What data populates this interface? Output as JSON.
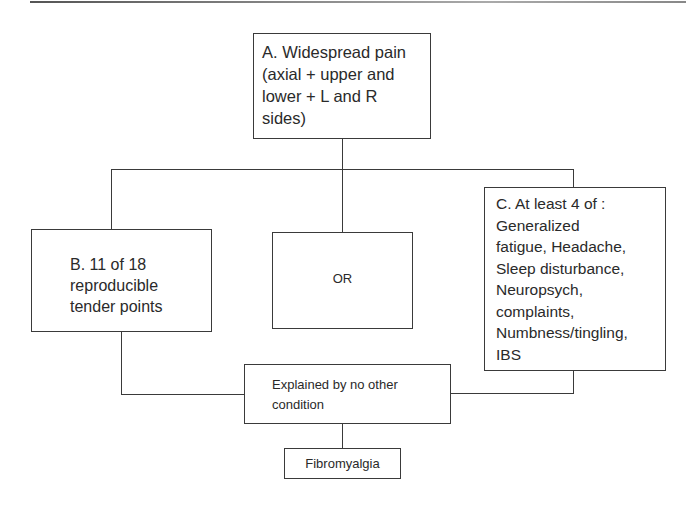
{
  "diagram": {
    "type": "flowchart",
    "nodes": {
      "a": {
        "label": "A. Widespread pain\n(axial + upper and\nlower + L and R\nsides)"
      },
      "b": {
        "label": "B. 11 of 18\nreproducible\ntender points"
      },
      "or": {
        "label": "OR"
      },
      "c": {
        "label": "C. At least 4 of :\nGeneralized\nfatigue, Headache,\nSleep disturbance,\nNeuropsych,\ncomplaints,\nNumbness/tingling,\nIBS"
      },
      "excl": {
        "label": "Explained by no other\ncondition"
      },
      "result": {
        "label": "Fibromyalgia"
      }
    },
    "edges": [
      {
        "from": "a",
        "to": "b"
      },
      {
        "from": "a",
        "to": "or"
      },
      {
        "from": "a",
        "to": "c"
      },
      {
        "from": "b",
        "to": "excl"
      },
      {
        "from": "c",
        "to": "excl"
      },
      {
        "from": "excl",
        "to": "result"
      }
    ],
    "colors": {
      "line": "#3a3a3a",
      "text": "#2a2a2a",
      "background": "#ffffff"
    }
  }
}
